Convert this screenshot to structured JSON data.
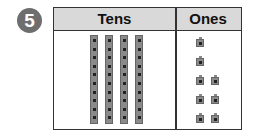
{
  "problem_number": "5",
  "table": {
    "headers": {
      "tens": "Tens",
      "ones": "Ones"
    },
    "tens_rods": 4,
    "cubes_per_rod": 10,
    "ones_cubes": 8,
    "ones_rows": [
      1,
      1,
      2,
      2,
      2
    ]
  }
}
